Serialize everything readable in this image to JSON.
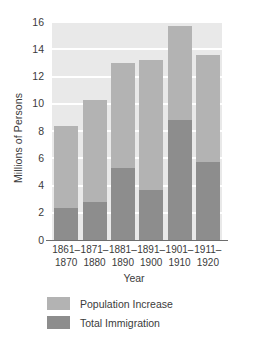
{
  "chart_data": {
    "type": "bar",
    "stacked": true,
    "title": "",
    "xlabel": "Year",
    "ylabel": "Millions of Persons",
    "categories": [
      "1861–\n1870",
      "1871–\n1880",
      "1881–\n1890",
      "1891–\n1900",
      "1901–\n1910",
      "1911–\n1920"
    ],
    "category_lines": [
      [
        "1861–",
        "1870"
      ],
      [
        "1871–",
        "1880"
      ],
      [
        "1881–",
        "1890"
      ],
      [
        "1891–",
        "1900"
      ],
      [
        "1901–",
        "1910"
      ],
      [
        "1911–",
        "1920"
      ]
    ],
    "series": [
      {
        "name": "Total Immigration",
        "color": "#8d8d8d",
        "values": [
          2.35,
          2.8,
          5.3,
          3.7,
          8.8,
          5.7
        ]
      },
      {
        "name": "Population Increase",
        "color": "#b3b3b3",
        "values": [
          6.05,
          7.5,
          7.7,
          9.5,
          6.9,
          7.9
        ]
      }
    ],
    "totals": [
      8.4,
      10.3,
      13.0,
      13.2,
      15.7,
      13.6
    ],
    "ylim": [
      0,
      16
    ],
    "yticks": [
      0,
      2,
      4,
      6,
      8,
      10,
      12,
      14,
      16
    ],
    "ytick_labels": [
      "0",
      "2",
      "4",
      "6",
      "8",
      "10",
      "12",
      "14",
      "16"
    ],
    "grid": true,
    "grid_color": "#ffffff",
    "plot_background": "#e9e9e9",
    "legend_position": "bottom-left",
    "legend": [
      {
        "label": "Population Increase",
        "color": "#b3b3b3"
      },
      {
        "label": "Total Immigration",
        "color": "#8d8d8d"
      }
    ]
  }
}
